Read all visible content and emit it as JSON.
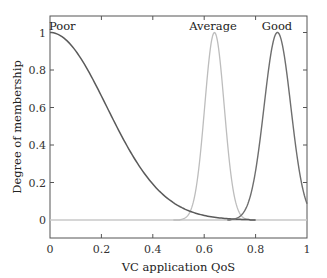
{
  "chart_data": {
    "type": "line",
    "title": "",
    "xlabel": "VC application QoS",
    "ylabel": "Degree of membership",
    "xlim": [
      0,
      1
    ],
    "ylim": [
      -0.1,
      1.1
    ],
    "grid": false,
    "legend": "inline labels near curve peaks",
    "x_ticks": [
      0,
      0.2,
      0.4,
      0.6,
      0.8,
      1
    ],
    "x_tick_labels": [
      "0",
      "0.2",
      "0.4",
      "0.6",
      "0.8",
      "1"
    ],
    "y_ticks": [
      0,
      0.2,
      0.4,
      0.6,
      0.8,
      1
    ],
    "y_tick_labels": [
      "0",
      "0.2",
      "0.4",
      "0.6",
      "0.8",
      "1"
    ],
    "series": [
      {
        "name": "Poor",
        "color": "#5a5a5a",
        "shape": "half-gaussian",
        "center": 0,
        "sigma": 0.22,
        "x": [
          0,
          0.05,
          0.1,
          0.15,
          0.2,
          0.25,
          0.3,
          0.35,
          0.4,
          0.45,
          0.5,
          0.55,
          0.6,
          0.65,
          0.7,
          0.75,
          0.8
        ],
        "values": [
          1.0,
          0.97,
          0.9,
          0.79,
          0.66,
          0.52,
          0.39,
          0.28,
          0.19,
          0.12,
          0.08,
          0.05,
          0.03,
          0.01,
          0.0,
          0.0,
          0.0
        ]
      },
      {
        "name": "Average",
        "color": "#bdbdbd",
        "shape": "gaussian",
        "center": 0.64,
        "sigma": 0.038,
        "x": [
          0.48,
          0.52,
          0.56,
          0.58,
          0.6,
          0.62,
          0.64,
          0.66,
          0.68,
          0.7,
          0.72,
          0.76,
          0.8
        ],
        "values": [
          0.0,
          0.01,
          0.11,
          0.29,
          0.58,
          0.87,
          1.0,
          0.87,
          0.58,
          0.29,
          0.11,
          0.01,
          0.0
        ]
      },
      {
        "name": "Good",
        "color": "#6e6e6e",
        "shape": "gaussian",
        "center": 0.885,
        "sigma": 0.052,
        "x": [
          0.69,
          0.72,
          0.76,
          0.8,
          0.84,
          0.86,
          0.885,
          0.91,
          0.93,
          0.96,
          1.0
        ],
        "values": [
          0.0,
          0.01,
          0.06,
          0.26,
          0.69,
          0.89,
          1.0,
          0.89,
          0.69,
          0.35,
          0.08
        ]
      },
      {
        "name": "Baseline",
        "color": "#c8c8c8",
        "x": [
          0,
          1
        ],
        "values": [
          0,
          0
        ]
      }
    ],
    "annotations": [
      {
        "text": "Poor",
        "x": 0.0,
        "y": 1.03
      },
      {
        "text": "Average",
        "x": 0.64,
        "y": 1.03
      },
      {
        "text": "Good",
        "x": 0.885,
        "y": 1.03
      }
    ]
  },
  "labels": {
    "xlabel": "VC application QoS",
    "ylabel": "Degree of membership",
    "poor": "Poor",
    "average": "Average",
    "good": "Good",
    "xt0": "0",
    "xt1": "0.2",
    "xt2": "0.4",
    "xt3": "0.6",
    "xt4": "0.8",
    "xt5": "1",
    "yt0": "0",
    "yt1": "0.2",
    "yt2": "0.4",
    "yt3": "0.6",
    "yt4": "0.8",
    "yt5": "1"
  }
}
